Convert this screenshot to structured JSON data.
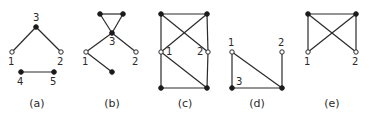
{
  "figure": {
    "panels": [
      {
        "id": "a",
        "caption": "(a)",
        "caption_pos": [
          37,
          107
        ],
        "nodes": [
          {
            "id": "3",
            "label": "3",
            "x": 36,
            "y": 27,
            "type": "filled",
            "lx": -3,
            "ly": -6
          },
          {
            "id": "1",
            "label": "1",
            "x": 12,
            "y": 52,
            "type": "hollow",
            "lx": -4,
            "ly": 13
          },
          {
            "id": "2",
            "label": "2",
            "x": 61,
            "y": 52,
            "type": "hollow",
            "lx": -4,
            "ly": 13
          },
          {
            "id": "4",
            "label": "4",
            "x": 21,
            "y": 72,
            "type": "filled",
            "lx": -4,
            "ly": 13
          },
          {
            "id": "5",
            "label": "5",
            "x": 54,
            "y": 72,
            "type": "filled",
            "lx": -4,
            "ly": 13
          }
        ],
        "edges": [
          [
            "3",
            "1"
          ],
          [
            "3",
            "2"
          ],
          [
            "4",
            "5"
          ]
        ]
      },
      {
        "id": "b",
        "caption": "(b)",
        "caption_pos": [
          112,
          107
        ],
        "nodes": [
          {
            "id": "t1",
            "label": "",
            "x": 100,
            "y": 14,
            "type": "filled"
          },
          {
            "id": "t2",
            "label": "",
            "x": 123,
            "y": 14,
            "type": "filled"
          },
          {
            "id": "3",
            "label": "3",
            "x": 112,
            "y": 33,
            "type": "filled",
            "lx": -3,
            "ly": 12
          },
          {
            "id": "1",
            "label": "1",
            "x": 86,
            "y": 52,
            "type": "hollow",
            "lx": -4,
            "ly": 13
          },
          {
            "id": "2",
            "label": "2",
            "x": 136,
            "y": 52,
            "type": "hollow",
            "lx": -4,
            "ly": 13
          },
          {
            "id": "b",
            "label": "",
            "x": 112,
            "y": 72,
            "type": "filled"
          }
        ],
        "edges": [
          [
            "t1",
            "t2"
          ],
          [
            "t1",
            "3"
          ],
          [
            "t2",
            "3"
          ],
          [
            "3",
            "1"
          ],
          [
            "3",
            "2"
          ],
          [
            "1",
            "b"
          ]
        ]
      },
      {
        "id": "c",
        "caption": "(c)",
        "caption_pos": [
          185,
          107
        ],
        "nodes": [
          {
            "id": "tl",
            "label": "",
            "x": 161,
            "y": 14,
            "type": "filled"
          },
          {
            "id": "tr",
            "label": "",
            "x": 207,
            "y": 14,
            "type": "filled"
          },
          {
            "id": "1",
            "label": "1",
            "x": 161,
            "y": 52,
            "type": "hollow",
            "lx": 5,
            "ly": 3
          },
          {
            "id": "2",
            "label": "2",
            "x": 208,
            "y": 52,
            "type": "hollow",
            "lx": -11,
            "ly": 3
          },
          {
            "id": "bl",
            "label": "",
            "x": 161,
            "y": 88,
            "type": "filled"
          },
          {
            "id": "br",
            "label": "",
            "x": 207,
            "y": 88,
            "type": "filled"
          }
        ],
        "edges": [
          [
            "tl",
            "tr"
          ],
          [
            "tl",
            "1"
          ],
          [
            "1",
            "bl"
          ],
          [
            "tr",
            "2"
          ],
          [
            "2",
            "br"
          ],
          [
            "bl",
            "br"
          ],
          [
            "tl",
            "2"
          ],
          [
            "tr",
            "1"
          ],
          [
            "1",
            "br"
          ]
        ]
      },
      {
        "id": "d",
        "caption": "(d)",
        "caption_pos": [
          257,
          107
        ],
        "nodes": [
          {
            "id": "1",
            "label": "1",
            "x": 232,
            "y": 52,
            "type": "hollow",
            "lx": -4,
            "ly": -6
          },
          {
            "id": "2",
            "label": "2",
            "x": 282,
            "y": 52,
            "type": "hollow",
            "lx": -4,
            "ly": -6
          },
          {
            "id": "3",
            "label": "3",
            "x": 232,
            "y": 88,
            "type": "filled",
            "lx": 4,
            "ly": -3
          },
          {
            "id": "br",
            "label": "",
            "x": 282,
            "y": 88,
            "type": "filled"
          }
        ],
        "edges": [
          [
            "1",
            "3"
          ],
          [
            "1",
            "br"
          ],
          [
            "3",
            "br"
          ],
          [
            "2",
            "br"
          ]
        ]
      },
      {
        "id": "e",
        "caption": "(e)",
        "caption_pos": [
          332,
          107
        ],
        "nodes": [
          {
            "id": "tl",
            "label": "",
            "x": 308,
            "y": 14,
            "type": "filled"
          },
          {
            "id": "tr",
            "label": "",
            "x": 356,
            "y": 14,
            "type": "filled"
          },
          {
            "id": "1",
            "label": "1",
            "x": 308,
            "y": 52,
            "type": "hollow",
            "lx": -4,
            "ly": 13
          },
          {
            "id": "2",
            "label": "2",
            "x": 356,
            "y": 52,
            "type": "hollow",
            "lx": -4,
            "ly": 13
          }
        ],
        "edges": [
          [
            "tl",
            "tr"
          ],
          [
            "tl",
            "1"
          ],
          [
            "tr",
            "2"
          ],
          [
            "tl",
            "2"
          ],
          [
            "tr",
            "1"
          ]
        ]
      }
    ]
  }
}
